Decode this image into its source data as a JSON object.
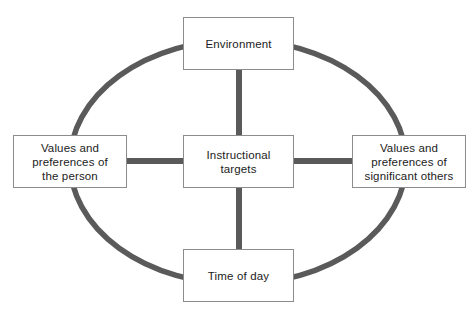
{
  "diagram": {
    "type": "hub-and-spoke with surrounding ellipse",
    "colors": {
      "background": "#ffffff",
      "ellipse_stroke": "#5a5a5a",
      "connector": "#5a5a5a",
      "box_border": "#8c8c8c",
      "box_fill": "#ffffff",
      "text": "#1c1c1c"
    },
    "ellipse": {
      "center_x": 238,
      "center_y": 162,
      "radius_x": 168,
      "radius_y": 122,
      "stroke_width": 5.5
    },
    "nodes": {
      "center": {
        "id": "instructional-targets",
        "label": "Instructional\ntargets"
      },
      "top": {
        "id": "environment",
        "label": "Environment"
      },
      "left": {
        "id": "values-preferences-person",
        "label": "Values and\npreferences of\nthe person"
      },
      "right": {
        "id": "values-preferences-significant-others",
        "label": "Values and\npreferences of\nsignificant others"
      },
      "bottom": {
        "id": "time-of-day",
        "label": "Time of day"
      }
    },
    "connectors": [
      {
        "id": "center-to-top",
        "from": "instructional-targets",
        "to": "environment",
        "orientation": "vertical"
      },
      {
        "id": "center-to-bottom",
        "from": "instructional-targets",
        "to": "time-of-day",
        "orientation": "vertical"
      },
      {
        "id": "center-to-left",
        "from": "instructional-targets",
        "to": "values-preferences-person",
        "orientation": "horizontal"
      },
      {
        "id": "center-to-right",
        "from": "instructional-targets",
        "to": "values-preferences-significant-others",
        "orientation": "horizontal"
      }
    ]
  }
}
